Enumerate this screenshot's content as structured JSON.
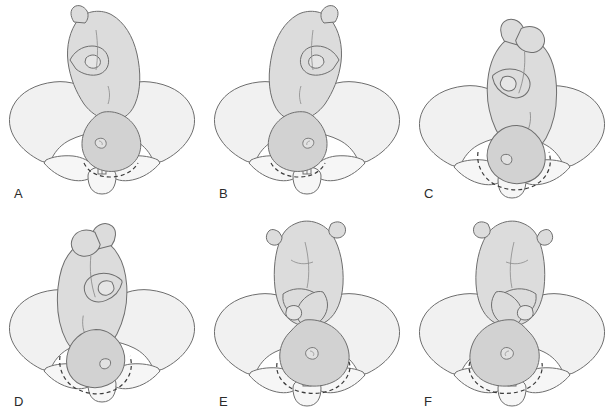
{
  "figure": {
    "panel_count": 6,
    "background_color": "#ffffff",
    "stroke_color": "#6e6e6e",
    "dashed_stroke_color": "#3a3a3a",
    "pelvis_fill": "#f1f1f1",
    "fetus_fill": "#dcdcdc",
    "head_fill": "#d2d2d2",
    "label_color": "#2b2b2b"
  },
  "panels": [
    {
      "id": "a",
      "label": "A",
      "caption": "Left occiput anterior",
      "fetus_rotation_deg": 0,
      "fetus_mirrored": false,
      "head_engaged": true,
      "limbs": "legs-flexed-body-upright",
      "head_offset_x": 10,
      "head_offset_y": 0
    },
    {
      "id": "b",
      "label": "B",
      "caption": "Right occiput anterior",
      "fetus_rotation_deg": 0,
      "fetus_mirrored": true,
      "head_engaged": true,
      "limbs": "legs-flexed-body-upright",
      "head_offset_x": -10,
      "head_offset_y": 0
    },
    {
      "id": "c",
      "label": "C",
      "caption": "Left occiput transverse",
      "fetus_rotation_deg": 14,
      "fetus_mirrored": false,
      "head_engaged": true,
      "limbs": "arms-flexed-body-tilted",
      "head_offset_x": 16,
      "head_offset_y": 8
    },
    {
      "id": "d",
      "label": "D",
      "caption": "Right occiput transverse",
      "fetus_rotation_deg": -14,
      "fetus_mirrored": true,
      "head_engaged": true,
      "limbs": "arms-flexed-body-tilted",
      "head_offset_x": -16,
      "head_offset_y": 8
    },
    {
      "id": "e",
      "label": "E",
      "caption": "Left occiput posterior",
      "fetus_rotation_deg": 0,
      "fetus_mirrored": false,
      "head_engaged": true,
      "limbs": "arms-crossed-over-chest",
      "head_offset_x": 4,
      "head_offset_y": 4
    },
    {
      "id": "f",
      "label": "F",
      "caption": "Right occiput posterior",
      "fetus_rotation_deg": 0,
      "fetus_mirrored": true,
      "head_engaged": true,
      "limbs": "arms-crossed-over-chest",
      "head_offset_x": -4,
      "head_offset_y": 4
    }
  ]
}
